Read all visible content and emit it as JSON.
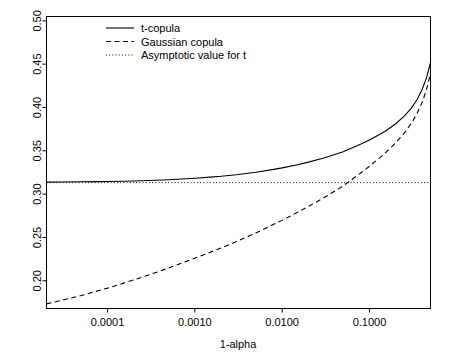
{
  "chart_data": {
    "type": "line",
    "title": "",
    "xlabel": "1-alpha",
    "ylabel": "",
    "xscale": "log",
    "xlim": [
      2e-05,
      0.5
    ],
    "ylim": [
      0.168,
      0.505
    ],
    "grid": false,
    "legend_position": "top-left",
    "xticks": [
      0.0001,
      0.001,
      0.01,
      0.1
    ],
    "xtick_labels": [
      "0.0001",
      "0.0010",
      "0.0100",
      "0.1000"
    ],
    "yticks": [
      0.2,
      0.25,
      0.3,
      0.35,
      0.4,
      0.45,
      0.5
    ],
    "ytick_labels": [
      "0.20",
      "0.25",
      "0.30",
      "0.35",
      "0.40",
      "0.45",
      "0.50"
    ],
    "series": [
      {
        "name": "t-copula",
        "style": "solid",
        "x": [
          2e-05,
          3e-05,
          5e-05,
          8e-05,
          0.0001,
          0.00015,
          0.0002,
          0.0003,
          0.0005,
          0.0008,
          0.001,
          0.0015,
          0.002,
          0.003,
          0.005,
          0.008,
          0.01,
          0.015,
          0.02,
          0.03,
          0.05,
          0.08,
          0.1,
          0.15,
          0.2,
          0.25,
          0.3,
          0.35,
          0.4,
          0.45,
          0.5
        ],
        "values": [
          0.3139,
          0.314,
          0.3142,
          0.3144,
          0.3146,
          0.3149,
          0.3152,
          0.3157,
          0.3166,
          0.3177,
          0.3183,
          0.3196,
          0.3206,
          0.3224,
          0.3252,
          0.3286,
          0.3303,
          0.334,
          0.3369,
          0.3416,
          0.3489,
          0.3578,
          0.3624,
          0.3723,
          0.3812,
          0.3899,
          0.3989,
          0.4089,
          0.4204,
          0.4342,
          0.452
        ]
      },
      {
        "name": "Gaussian copula",
        "style": "dashed",
        "x": [
          2e-05,
          3e-05,
          5e-05,
          8e-05,
          0.0001,
          0.00015,
          0.0002,
          0.0003,
          0.0005,
          0.0008,
          0.001,
          0.0015,
          0.002,
          0.003,
          0.005,
          0.008,
          0.01,
          0.015,
          0.02,
          0.03,
          0.05,
          0.08,
          0.1,
          0.15,
          0.2,
          0.25,
          0.3,
          0.35,
          0.4,
          0.45,
          0.5
        ],
        "values": [
          0.1733,
          0.1775,
          0.1829,
          0.1888,
          0.1915,
          0.197,
          0.201,
          0.2069,
          0.2147,
          0.2224,
          0.226,
          0.2329,
          0.2378,
          0.2452,
          0.2552,
          0.2651,
          0.2697,
          0.279,
          0.2858,
          0.2958,
          0.3095,
          0.3247,
          0.3321,
          0.347,
          0.3592,
          0.3704,
          0.3813,
          0.3928,
          0.4056,
          0.4205,
          0.4395
        ]
      },
      {
        "name": "Asymptotic value for t",
        "style": "dotted",
        "constant_value": 0.3133,
        "x": [
          2e-05,
          0.5
        ],
        "values": [
          0.3133,
          0.3133
        ]
      }
    ],
    "annotations": [
      {
        "text": "Gaussian copula crosses asymptotic value",
        "x": 0.019,
        "y": 0.3133
      }
    ]
  },
  "legend": {
    "items": [
      {
        "label": "t-copula",
        "style": "solid"
      },
      {
        "label": "Gaussian copula",
        "style": "dashed"
      },
      {
        "label": "Asymptotic value for t",
        "style": "dotted"
      }
    ]
  },
  "colors": {
    "line": "#000000",
    "background": "#ffffff",
    "axis": "#000000"
  }
}
